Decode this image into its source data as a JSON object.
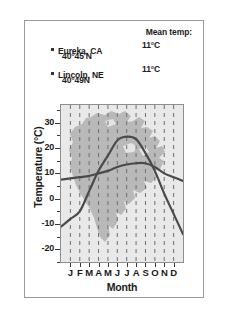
{
  "legend": {
    "header": "Mean temp:",
    "entries": [
      {
        "city": "Eureka, CA",
        "coordinates": "40°45'N",
        "mean_temp": "11°C",
        "bullet": "square-bullet-icon"
      },
      {
        "city": "Lincoln, NE",
        "coordinates": "40°49N",
        "mean_temp": "11°C",
        "bullet": "square-bullet-icon"
      }
    ]
  },
  "axes": {
    "ylabel": "Temperature (°C)",
    "xlabel": "Month",
    "yticks": [
      "30",
      "20",
      "10",
      "0",
      "-10",
      "-20"
    ],
    "xticks": [
      "J",
      "F",
      "M",
      "A",
      "M",
      "J",
      "J",
      "A",
      "S",
      "O",
      "N",
      "D"
    ]
  },
  "colors": {
    "plot_background": "#e9e9e9",
    "map_fill": "#a8a8a8",
    "curve": "#4a4a4a",
    "gridline": "#6f6f6f",
    "frame": "#8e8e8e",
    "text": "#1a1a1a"
  },
  "chart_data": {
    "type": "line",
    "title": "",
    "subtitle": "",
    "xlabel": "Month",
    "ylabel": "Temperature (°C)",
    "categories": [
      "J",
      "F",
      "M",
      "A",
      "M",
      "J",
      "J",
      "A",
      "S",
      "O",
      "N",
      "D"
    ],
    "ylim": [
      -25,
      37
    ],
    "xlim": [
      0,
      13
    ],
    "grid": "vertical-dashed",
    "legend_position": "above-plot",
    "annotations": [
      "North America map silhouette shown as background watermark inside plot area"
    ],
    "series": [
      {
        "name": "Eureka, CA",
        "mean_temp": 11,
        "latitude": "40°45'N",
        "values": [
          8,
          8.5,
          9,
          10,
          11,
          12.5,
          13.5,
          14,
          14,
          12.5,
          10,
          8.5
        ]
      },
      {
        "name": "Lincoln, NE",
        "mean_temp": 11,
        "latitude": "40°49N",
        "values": [
          -8,
          -5,
          3,
          11,
          17,
          23,
          24.5,
          23.5,
          18,
          11,
          2,
          -6
        ]
      }
    ]
  }
}
